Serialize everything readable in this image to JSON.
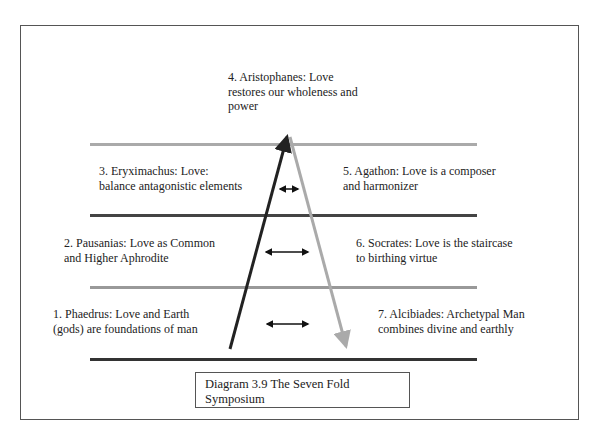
{
  "diagram": {
    "caption": "Diagram 3.9 The Seven Fold Symposium",
    "colors": {
      "dark_line": "#333333",
      "light_line": "#aaaaaa",
      "frame": "#555555"
    },
    "levels": [
      {
        "id": 1,
        "text": "1. Phaedrus: Love and Earth\n(gods) are foundations of man"
      },
      {
        "id": 2,
        "text": "2. Pausanias: Love as Common\nand Higher Aphrodite"
      },
      {
        "id": 3,
        "text": "3. Eryximachus: Love:\nbalance antagonistic elements"
      },
      {
        "id": 4,
        "text": "4. Aristophanes: Love\nrestores our wholeness and\npower"
      },
      {
        "id": 5,
        "text": "5. Agathon: Love is a composer\nand harmonizer"
      },
      {
        "id": 6,
        "text": "6. Socrates: Love is the staircase\nto birthing virtue"
      },
      {
        "id": 7,
        "text": "7. Alcibiades: Archetypal Man\ncombines divine and earthly"
      }
    ],
    "arrows": {
      "ascending": "dark arrow up (1→4)",
      "descending": "light arrow down (4→7)",
      "double_arrows": 3
    }
  }
}
